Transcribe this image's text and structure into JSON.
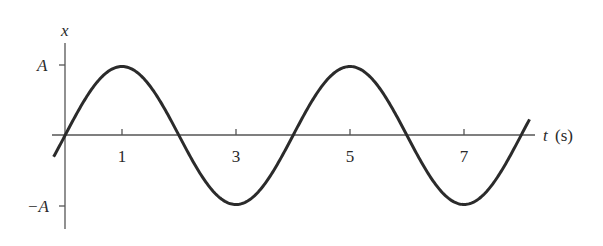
{
  "chart_data": {
    "type": "line",
    "title": "",
    "xlabel": "t (s)",
    "ylabel": "x",
    "xlabel_var": "t",
    "xlabel_unit": "(s)",
    "x_ticks": [
      1,
      3,
      5,
      7
    ],
    "x_tick_labels": [
      "1",
      "3",
      "5",
      "7"
    ],
    "y_ticks": [
      "A",
      "-A"
    ],
    "y_tick_labels": [
      "A",
      "−A"
    ],
    "function": "x(t) = A sin(π t / 2)",
    "amplitude": "A",
    "period_s": 4,
    "xlim": [
      -0.2,
      8.15
    ],
    "ylim": [
      "-A",
      "A"
    ],
    "series": [
      {
        "name": "x(t)",
        "x": [
          0,
          1,
          2,
          3,
          4,
          5,
          6,
          7,
          8
        ],
        "values": [
          0,
          1,
          0,
          -1,
          0,
          1,
          0,
          -1,
          0
        ],
        "value_units": "A"
      }
    ],
    "grid": false,
    "legend": null,
    "colors": {
      "curve": "#2b2b2b",
      "axis": "#555555",
      "text": "#2a2a2a"
    }
  },
  "labels": {
    "y_axis": "x",
    "x_axis_var": "t",
    "x_axis_unit": "(s)",
    "y_tick_pos": "A",
    "y_tick_neg": "−A",
    "t1": "1",
    "t3": "3",
    "t5": "5",
    "t7": "7"
  }
}
